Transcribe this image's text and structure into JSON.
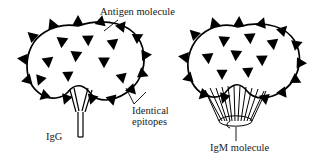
{
  "figure": {
    "background_color": "#ffffff",
    "ink_color": "#000000"
  },
  "labels": {
    "antigen_molecule": "Antigen molecule",
    "igg": "IgG",
    "identical_epitopes": "Identical\nepitopes",
    "identical_epitopes_line1": "Identical",
    "identical_epitopes_line2": "epitopes",
    "igm_molecule": "IgM molecule"
  },
  "diagram_data": {
    "type": "diagram",
    "panels": [
      {
        "name": "igg-panel",
        "antibody": "IgG",
        "antibody_arms": 2,
        "antigen_shape": "lobed blob with notch at bottom",
        "epitope_glyph": "filled triangle",
        "epitopes_on_rim": 14,
        "epitopes_inside": 9
      },
      {
        "name": "igm-panel",
        "antibody": "IgM molecule",
        "antibody_arms": 10,
        "antigen_shape": "lobed blob with notch at bottom",
        "epitope_glyph": "filled triangle",
        "epitopes_on_rim": 13,
        "epitopes_inside": 8
      }
    ],
    "leaders": [
      {
        "from": "Antigen molecule",
        "to": "rim epitope of left antigen"
      },
      {
        "from": "Identical epitopes",
        "to": "two epitopes of left antigen"
      },
      {
        "from": "IgM molecule",
        "to": "base of IgM antibody"
      }
    ]
  }
}
